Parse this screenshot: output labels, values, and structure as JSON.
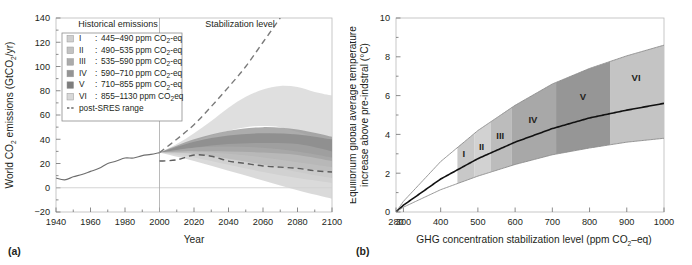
{
  "figure": {
    "panel_a_label": "(a)",
    "panel_b_label": "(b)"
  },
  "chart_data": [
    {
      "type": "area",
      "panel": "(a)",
      "title": "",
      "xlabel": "Year",
      "ylabel": "World CO2 emissions (GtCO2/yr)",
      "ylabel_parts": {
        "pre": "World CO",
        "sub1": "2",
        "mid": " emissions (GtCO",
        "sub2": "2",
        "post": "/yr)"
      },
      "xlim": [
        1940,
        2100
      ],
      "ylim": [
        -20,
        140
      ],
      "xticks": [
        1940,
        1960,
        1980,
        2000,
        2020,
        2040,
        2060,
        2080,
        2100
      ],
      "yticks": [
        -20,
        0,
        20,
        40,
        60,
        80,
        100,
        120,
        140
      ],
      "minor_xtick_step": 10,
      "minor_ytick_step": 10,
      "grid": false,
      "divider_year": 2000,
      "section_headers": [
        {
          "label": "Historical emissions",
          "x": 1972
        },
        {
          "label": "Stabilization level",
          "x": 2042
        }
      ],
      "legend": {
        "position": "upper-left-inset",
        "entries": [
          {
            "id": "I",
            "roman": "I",
            "range_label": "445–490 ppm CO2-eq",
            "range_text": "445–490 ppm CO",
            "suffix": "-eq",
            "color": "#cfcfcf",
            "ppm_low": 445,
            "ppm_high": 490
          },
          {
            "id": "II",
            "roman": "II",
            "range_label": "490–535 ppm CO2-eq",
            "range_text": "490–535 ppm CO",
            "suffix": "-eq",
            "color": "#c2c2c2",
            "ppm_low": 490,
            "ppm_high": 535
          },
          {
            "id": "III",
            "roman": "III",
            "range_label": "535–590 ppm CO2-eq",
            "range_text": "535–590 ppm CO",
            "suffix": "-eq",
            "color": "#ababab",
            "ppm_low": 535,
            "ppm_high": 590
          },
          {
            "id": "IV",
            "roman": "IV",
            "range_label": "590–710 ppm CO2-eq",
            "range_text": "590–710 ppm CO",
            "suffix": "-eq",
            "color": "#949494",
            "ppm_low": 590,
            "ppm_high": 710
          },
          {
            "id": "V",
            "roman": "V",
            "range_label": "710–855 ppm CO2-eq",
            "range_text": "710–855 ppm CO",
            "suffix": "-eq",
            "color": "#7d7d7d",
            "ppm_low": 710,
            "ppm_high": 855
          },
          {
            "id": "VI",
            "roman": "VI",
            "range_label": "855–1130 ppm CO2eq",
            "range_text": "855–1130 ppm CO",
            "suffix": "eq",
            "color": "#d8d8d8",
            "ppm_low": 855,
            "ppm_high": 1130
          }
        ],
        "dashed_entry": {
          "label": "post-SRES range",
          "color": "#6b6b6b"
        }
      },
      "historical": {
        "name": "Historical emissions",
        "x": [
          1940,
          1945,
          1950,
          1955,
          1960,
          1965,
          1970,
          1975,
          1980,
          1985,
          1990,
          1995,
          2000
        ],
        "y": [
          8,
          6.5,
          9,
          11,
          13.5,
          16,
          20,
          22,
          24.5,
          24.5,
          26.5,
          27.5,
          29
        ]
      },
      "post_sres_upper": {
        "name": "post-SRES range upper",
        "x": [
          2000,
          2010,
          2020,
          2030,
          2040,
          2050,
          2060,
          2070
        ],
        "y": [
          29,
          40,
          52,
          67,
          83,
          100,
          120,
          140
        ]
      },
      "post_sres_lower": {
        "name": "post-SRES range lower",
        "x": [
          2000,
          2010,
          2020,
          2030,
          2040,
          2050,
          2060,
          2070,
          2080,
          2090,
          2100
        ],
        "y": [
          22,
          23,
          27,
          26,
          22,
          20,
          18,
          17,
          16,
          14,
          13
        ]
      },
      "bands": [
        {
          "id": "VI",
          "color": "#d8d8d8",
          "upper": {
            "x": [
              2000,
              2010,
              2020,
              2030,
              2040,
              2050,
              2060,
              2070,
              2080,
              2090,
              2100
            ],
            "y": [
              29,
              36,
              45,
              55,
              66,
              75,
              81,
              84,
              83,
              79,
              76
            ]
          },
          "lower": {
            "x": [
              2000,
              2010,
              2020,
              2030,
              2040,
              2050,
              2060,
              2070,
              2080,
              2090,
              2100
            ],
            "y": [
              29,
              32,
              38,
              43,
              47,
              50,
              51,
              50,
              46,
              42,
              40
            ]
          }
        },
        {
          "id": "V",
          "color": "#9a9a9a",
          "upper": {
            "x": [
              2000,
              2020,
              2040,
              2060,
              2080,
              2100
            ],
            "y": [
              29,
              40,
              47,
              50,
              48,
              42
            ]
          },
          "lower": {
            "x": [
              2000,
              2020,
              2040,
              2060,
              2080,
              2100
            ],
            "y": [
              29,
              33,
              36,
              37,
              36,
              30
            ]
          }
        },
        {
          "id": "IV",
          "color": "#8a8a8a",
          "upper": {
            "x": [
              2000,
              2020,
              2040,
              2060,
              2080,
              2100
            ],
            "y": [
              29,
              38,
              43,
              45,
              44,
              40
            ]
          },
          "lower": {
            "x": [
              2000,
              2020,
              2040,
              2060,
              2080,
              2100
            ],
            "y": [
              29,
              30,
              30,
              29,
              27,
              22
            ]
          }
        },
        {
          "id": "III",
          "color": "#a8a8a8",
          "upper": {
            "x": [
              2000,
              2020,
              2040,
              2060,
              2080,
              2100
            ],
            "y": [
              29,
              33,
              34,
              33,
              30,
              25
            ]
          },
          "lower": {
            "x": [
              2000,
              2020,
              2040,
              2060,
              2080,
              2100
            ],
            "y": [
              29,
              27,
              23,
              19,
              16,
              13
            ]
          }
        },
        {
          "id": "II",
          "color": "#c0c0c0",
          "upper": {
            "x": [
              2000,
              2020,
              2040,
              2060,
              2080,
              2100
            ],
            "y": [
              29,
              30,
              28,
              25,
              21,
              17
            ]
          },
          "lower": {
            "x": [
              2000,
              2020,
              2040,
              2060,
              2080,
              2100
            ],
            "y": [
              29,
              25,
              19,
              13,
              8,
              4
            ]
          }
        },
        {
          "id": "I",
          "color": "#d2d2d2",
          "upper": {
            "x": [
              2000,
              2020,
              2040,
              2060,
              2080,
              2100
            ],
            "y": [
              29,
              28,
              24,
              19,
              13,
              8
            ]
          },
          "lower": {
            "x": [
              2000,
              2020,
              2040,
              2060,
              2080,
              2100
            ],
            "y": [
              29,
              22,
              14,
              6,
              -2,
              -9
            ]
          }
        }
      ]
    },
    {
      "type": "area",
      "panel": "(b)",
      "title": "",
      "xlabel": "GHG concentration stabilization level (ppm CO2-eq)",
      "xlabel_parts": {
        "pre": "GHG concentration stabilization level (ppm CO",
        "sub": "2",
        "post": "–eq)"
      },
      "ylabel": "Equilibrium global average temperature increase above pre-indstral (°C)",
      "ylabel_line1": "Equilibrium global average temperature",
      "ylabel_line2": "increase above pre-indstral (°C)",
      "xlim": [
        280,
        1000
      ],
      "ylim": [
        0,
        10
      ],
      "xticks": [
        280,
        300,
        400,
        500,
        600,
        700,
        800,
        900,
        1000
      ],
      "yticks": [
        0,
        2,
        4,
        6,
        8,
        10
      ],
      "minor_ytick_step": 1,
      "grid": false,
      "curves": [
        {
          "name": "upper bound",
          "color": "#8c8c8c",
          "x": [
            280,
            300,
            400,
            500,
            600,
            700,
            800,
            900,
            1000
          ],
          "y": [
            0,
            0.55,
            2.6,
            4.2,
            5.5,
            6.6,
            7.4,
            8.05,
            8.6
          ]
        },
        {
          "name": "best estimate",
          "color": "#111111",
          "x": [
            280,
            300,
            400,
            500,
            600,
            700,
            800,
            900,
            1000
          ],
          "y": [
            0,
            0.35,
            1.7,
            2.75,
            3.6,
            4.3,
            4.85,
            5.25,
            5.6
          ]
        },
        {
          "name": "lower bound",
          "color": "#8c8c8c",
          "x": [
            280,
            300,
            400,
            500,
            600,
            700,
            800,
            900,
            1000
          ],
          "y": [
            0,
            0.25,
            1.15,
            1.85,
            2.45,
            2.95,
            3.3,
            3.6,
            3.8
          ]
        }
      ],
      "bands": [
        {
          "id": "I",
          "label": "I",
          "ppm_low": 445,
          "ppm_high": 490,
          "color": "#c8c8c8",
          "label_x": 462,
          "label_y": 2.85
        },
        {
          "id": "II",
          "label": "II",
          "ppm_low": 490,
          "ppm_high": 535,
          "color": "#d2d2d2",
          "label_x": 510,
          "label_y": 3.2
        },
        {
          "id": "III",
          "label": "III",
          "ppm_low": 535,
          "ppm_high": 590,
          "color": "#bcbcbc",
          "label_x": 560,
          "label_y": 3.75
        },
        {
          "id": "IV",
          "label": "IV",
          "ppm_low": 590,
          "ppm_high": 710,
          "color": "#a8a8a8",
          "label_x": 648,
          "label_y": 4.6
        },
        {
          "id": "V",
          "label": "V",
          "ppm_low": 710,
          "ppm_high": 855,
          "color": "#969696",
          "label_x": 782,
          "label_y": 5.75
        },
        {
          "id": "VI",
          "label": "VI",
          "ppm_low": 855,
          "ppm_high": 1000,
          "color": "#c4c4c4",
          "label_x": 925,
          "label_y": 6.75
        }
      ]
    }
  ]
}
